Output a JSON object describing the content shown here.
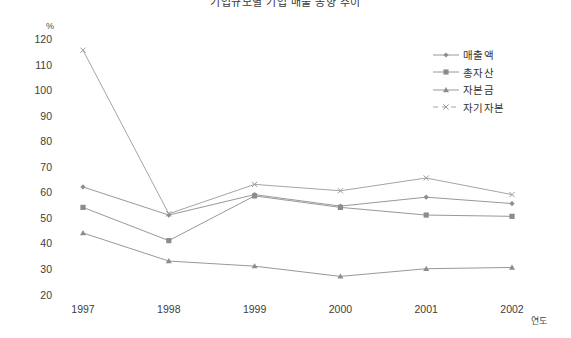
{
  "chart_data": {
    "type": "line",
    "title": "기업규모별 기업 매출 동향 추이",
    "xlabel": "연도",
    "ylabel": "%",
    "categories": [
      "1997",
      "1998",
      "1999",
      "2000",
      "2001",
      "2002"
    ],
    "ylim": [
      20,
      120
    ],
    "ytick_labels": [
      "120",
      "110",
      "100",
      "90",
      "80",
      "70",
      "60",
      "50",
      "40",
      "30",
      "20"
    ],
    "ytick_values": [
      120,
      110,
      100,
      90,
      80,
      70,
      60,
      50,
      40,
      30,
      20
    ],
    "grid": false,
    "legend_position": "right",
    "series": [
      {
        "name": "매출액",
        "marker": "diamond",
        "linestyle": "solid",
        "color": "#8c8c8c",
        "values": [
          62.5,
          51.5,
          59.5,
          55.0,
          58.5,
          56.0
        ]
      },
      {
        "name": "총자산",
        "marker": "square",
        "linestyle": "solid",
        "color": "#8c8c8c",
        "values": [
          54.5,
          41.5,
          59.0,
          54.5,
          51.5,
          51.0
        ]
      },
      {
        "name": "자본금",
        "marker": "triangle",
        "linestyle": "solid",
        "color": "#8c8c8c",
        "values": [
          44.5,
          33.5,
          31.5,
          27.5,
          30.5,
          31.0
        ]
      },
      {
        "name": "자기자본",
        "marker": "x",
        "linestyle": "dashed",
        "color": "#9a9a9a",
        "values": [
          116.0,
          52.0,
          63.5,
          61.0,
          66.0,
          59.5
        ]
      }
    ]
  },
  "axes": {
    "y_unit": "%",
    "x_title": "연도"
  },
  "legend": {
    "items": [
      {
        "label": "매출액"
      },
      {
        "label": "총자산"
      },
      {
        "label": "자본금"
      },
      {
        "label": "자기자본"
      }
    ]
  },
  "colors": {
    "line": "#8c8c8c",
    "text": "#3d3d3d",
    "background": "#ffffff"
  }
}
